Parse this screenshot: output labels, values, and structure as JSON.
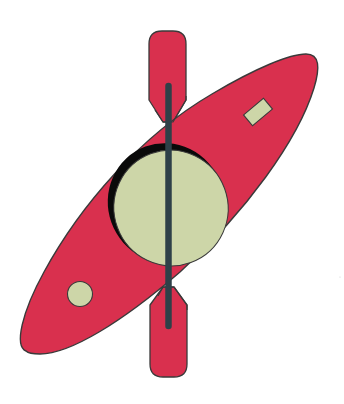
{
  "illustration": {
    "subject": "Kayak with double-bladed paddle",
    "colors": {
      "background": "#ffffff",
      "hull": "#d9304e",
      "outline": "#3a3a3a",
      "cockpit": "#cdd6a8",
      "cockpit_shadow": "#0a0a0a",
      "hatch": "#cdd6a8",
      "paddle_blade": "#d9304e",
      "paddle_shaft": "#2e4048"
    },
    "parts": [
      {
        "id": "hull",
        "label": "Kayak hull"
      },
      {
        "id": "cockpit",
        "label": "Cockpit opening"
      },
      {
        "id": "bow-hatch",
        "label": "Rectangular deck hatch"
      },
      {
        "id": "stern-hatch",
        "label": "Round deck hatch"
      },
      {
        "id": "paddle-top-blade",
        "label": "Paddle top blade"
      },
      {
        "id": "paddle-bottom-blade",
        "label": "Paddle bottom blade"
      },
      {
        "id": "paddle-shaft",
        "label": "Paddle shaft"
      }
    ]
  }
}
